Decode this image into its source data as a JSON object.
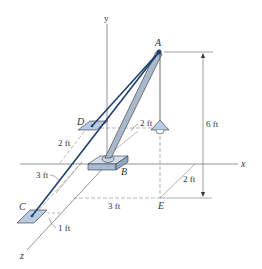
{
  "diagram": {
    "axes": {
      "x": "x",
      "y": "y",
      "z": "z"
    },
    "points": {
      "A": "A",
      "B": "B",
      "C": "C",
      "D": "D",
      "E": "E"
    },
    "dimensions": {
      "height_A": "6 ft",
      "d_offset": "2 ft",
      "dz_D": "2 ft",
      "cable_C": "3 ft",
      "c_offset": "1 ft",
      "e_x": "3 ft",
      "e_z": "2 ft"
    },
    "colors": {
      "cable": "#1f3f6e",
      "boom": "#aab8cc",
      "plate": "#b9cbe3",
      "line": "#666666"
    }
  }
}
